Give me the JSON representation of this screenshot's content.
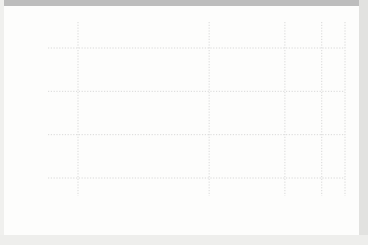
{
  "figure": {
    "background_color": "#fdfdfc",
    "axis_color": "#555555",
    "grid_color": "#cfcfcf",
    "marker_color": "#111111",
    "curve_color": "#444444"
  },
  "chart_data": {
    "type": "scatter",
    "title": "",
    "xlabel": "Cluster size, N",
    "ylabel": "Ionization potential, K clusters (eV)",
    "xscale": "N^(-1/3)",
    "xticks": [
      10,
      25,
      50,
      75,
      100
    ],
    "xtick_labels": [
      "10",
      "25",
      "50",
      "75",
      "100"
    ],
    "yticks": [
      2.5,
      3.0,
      3.5,
      4.0
    ],
    "ytick_labels": [
      "2.5",
      "3.0",
      "3.5",
      "4.0"
    ],
    "xlim": [
      7,
      102
    ],
    "ylim": [
      2.22,
      4.45
    ],
    "grid": "dotted horizontal and vertical at ticks",
    "legend": "none",
    "annotations": [
      {
        "text": "Bulk potassium work function",
        "value": 2.3,
        "type": "horizontal-reference-line-with-label"
      }
    ],
    "series": [
      {
        "name": "Measured ionization potential",
        "marker": "filled-square",
        "points": [
          [
            7.6,
            4.35
          ],
          [
            8.2,
            4.07
          ],
          [
            9.0,
            3.52
          ],
          [
            9.3,
            3.38
          ],
          [
            10.0,
            3.3
          ],
          [
            10.4,
            3.26
          ],
          [
            10.2,
            3.22
          ],
          [
            10.9,
            3.3
          ],
          [
            10.0,
            3.15
          ],
          [
            11.2,
            3.04
          ],
          [
            11.6,
            3.05
          ],
          [
            12.4,
            3.1
          ],
          [
            12.9,
            3.13
          ],
          [
            13.2,
            3.02
          ],
          [
            13.8,
            3.0
          ],
          [
            14.4,
            3.08
          ],
          [
            15.0,
            3.05
          ],
          [
            15.6,
            3.06
          ],
          [
            16.2,
            3.08
          ],
          [
            17.0,
            3.09
          ],
          [
            17.8,
            3.05
          ],
          [
            18.6,
            2.99
          ],
          [
            19.4,
            2.97
          ],
          [
            19.8,
            2.86
          ],
          [
            20.6,
            2.87
          ],
          [
            21.5,
            2.9
          ],
          [
            22.5,
            2.94
          ],
          [
            23.4,
            2.93
          ],
          [
            24.3,
            2.95
          ],
          [
            25.2,
            2.95
          ],
          [
            25.8,
            2.93
          ],
          [
            26.5,
            2.82
          ],
          [
            27.6,
            2.91
          ],
          [
            28.5,
            2.92
          ],
          [
            29.4,
            2.92
          ],
          [
            30.6,
            2.89
          ],
          [
            31.8,
            2.89
          ],
          [
            33.0,
            2.89
          ],
          [
            34.4,
            2.88
          ],
          [
            35.8,
            2.88
          ],
          [
            37.2,
            2.88
          ],
          [
            38.8,
            2.87
          ],
          [
            40.4,
            2.88
          ],
          [
            41.5,
            2.79
          ],
          [
            42.6,
            2.84
          ],
          [
            43.8,
            2.85
          ],
          [
            45.2,
            2.85
          ],
          [
            46.6,
            2.84
          ],
          [
            48.0,
            2.83
          ],
          [
            49.6,
            2.83
          ],
          [
            51.2,
            2.84
          ],
          [
            52.8,
            2.84
          ],
          [
            54.4,
            2.86
          ],
          [
            55.6,
            2.87
          ],
          [
            56.8,
            2.85
          ],
          [
            58.2,
            2.8
          ],
          [
            59.8,
            2.79
          ],
          [
            61.4,
            2.78
          ],
          [
            63.0,
            2.79
          ],
          [
            64.6,
            2.78
          ],
          [
            66.4,
            2.78
          ],
          [
            68.2,
            2.78
          ],
          [
            70.0,
            2.79
          ],
          [
            71.8,
            2.77
          ],
          [
            73.6,
            2.78
          ],
          [
            75.4,
            2.78
          ],
          [
            77.2,
            2.79
          ],
          [
            79.0,
            2.79
          ],
          [
            80.8,
            2.79
          ],
          [
            82.6,
            2.79
          ],
          [
            84.4,
            2.79
          ],
          [
            86.2,
            2.79
          ],
          [
            87.6,
            2.79
          ],
          [
            88.6,
            2.79
          ],
          [
            89.4,
            2.79
          ],
          [
            91.0,
            2.72
          ],
          [
            92.2,
            2.73
          ],
          [
            93.4,
            2.71
          ],
          [
            94.6,
            2.73
          ],
          [
            98.0,
            2.72
          ]
        ]
      },
      {
        "name": "Liquid-drop fit curve",
        "type": "line",
        "points": [
          [
            7.4,
            4.5
          ],
          [
            7.8,
            4.22
          ],
          [
            8.2,
            4.0
          ],
          [
            8.8,
            3.76
          ],
          [
            9.4,
            3.6
          ],
          [
            10.0,
            3.48
          ],
          [
            11.0,
            3.35
          ],
          [
            12.0,
            3.26
          ],
          [
            13.0,
            3.19
          ],
          [
            14.0,
            3.14
          ],
          [
            15.0,
            3.1
          ],
          [
            16.5,
            3.05
          ],
          [
            18.0,
            3.01
          ],
          [
            20.0,
            2.98
          ],
          [
            22.0,
            2.96
          ],
          [
            25.0,
            2.94
          ],
          [
            28.0,
            2.92
          ],
          [
            32.0,
            2.9
          ],
          [
            36.0,
            2.89
          ],
          [
            40.0,
            2.87
          ],
          [
            45.0,
            2.86
          ],
          [
            50.0,
            2.85
          ],
          [
            55.0,
            2.84
          ],
          [
            60.0,
            2.83
          ],
          [
            65.0,
            2.82
          ],
          [
            70.0,
            2.81
          ],
          [
            75.0,
            2.8
          ],
          [
            80.0,
            2.79
          ],
          [
            85.0,
            2.78
          ],
          [
            90.0,
            2.76
          ],
          [
            95.0,
            2.75
          ],
          [
            100.0,
            2.73
          ]
        ]
      }
    ]
  }
}
